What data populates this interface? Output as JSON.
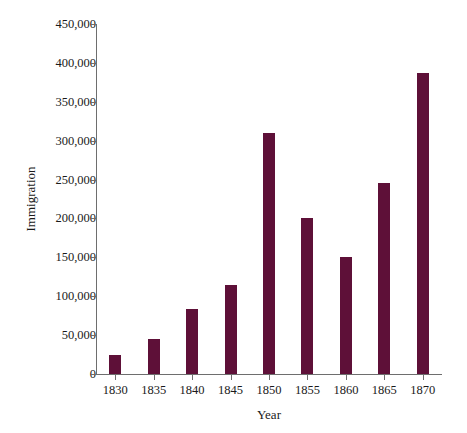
{
  "chart_data": {
    "type": "bar",
    "title": "",
    "xlabel": "Year",
    "ylabel": "Immigration",
    "categories": [
      "1830",
      "1835",
      "1840",
      "1845",
      "1850",
      "1855",
      "1860",
      "1865",
      "1870"
    ],
    "values": [
      24000,
      45000,
      84000,
      114000,
      310000,
      200000,
      151000,
      246000,
      387000
    ],
    "ylim": [
      0,
      450000
    ],
    "ytick_values": [
      0,
      50000,
      100000,
      150000,
      200000,
      250000,
      300000,
      350000,
      400000,
      450000
    ],
    "ytick_labels": [
      "0",
      "50,000",
      "100,000",
      "150,000",
      "200,000",
      "250,000",
      "300,000",
      "350,000",
      "400,000",
      "450,000"
    ],
    "grid": false,
    "legend": null,
    "bar_color": "#5e1038",
    "axis_color": "#6e6e6e",
    "background_color": "#ffffff"
  }
}
